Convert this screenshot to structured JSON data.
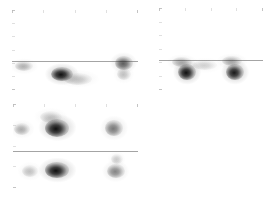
{
  "figure": {
    "title": "",
    "background": "#ffffff",
    "width": 273,
    "height": 203,
    "grid_color": "#b9b9b9",
    "divider_color": "#9a9a9a",
    "blob_color": "#1a1a1a"
  },
  "chart_data": {
    "type": "heatmap",
    "title": "",
    "subtitle": "",
    "xlabel": "",
    "ylabel": "",
    "legend": [],
    "annotations": [],
    "layout": {
      "panels": 3,
      "arrangement": "2x2 with bottom-right empty",
      "grid": "dashed",
      "colormap": "grayscale-inverted"
    },
    "panels": [
      {
        "name": "panel-top-left",
        "x": 12,
        "y": 10,
        "width": 126,
        "height": 80,
        "grid_cols": 4,
        "grid_rows": 6,
        "divider_y_frac": 0.64,
        "spots": [
          {
            "cx_frac": 0.095,
            "cy_frac": 0.7,
            "rx": 9,
            "ry": 5,
            "intensity": 0.28
          },
          {
            "cx_frac": 0.4,
            "cy_frac": 0.8,
            "rx": 11,
            "ry": 7,
            "intensity": 1.0
          },
          {
            "cx_frac": 0.52,
            "cy_frac": 0.86,
            "rx": 14,
            "ry": 6,
            "intensity": 0.22
          },
          {
            "cx_frac": 0.885,
            "cy_frac": 0.66,
            "rx": 9,
            "ry": 7,
            "intensity": 0.62
          },
          {
            "cx_frac": 0.885,
            "cy_frac": 0.8,
            "rx": 7,
            "ry": 6,
            "intensity": 0.22
          }
        ]
      },
      {
        "name": "panel-top-right",
        "x": 159,
        "y": 8,
        "width": 104,
        "height": 82,
        "grid_cols": 4,
        "grid_rows": 6,
        "divider_y_frac": 0.63,
        "spots": [
          {
            "cx_frac": 0.27,
            "cy_frac": 0.78,
            "rx": 9,
            "ry": 8,
            "intensity": 1.0
          },
          {
            "cx_frac": 0.22,
            "cy_frac": 0.66,
            "rx": 10,
            "ry": 5,
            "intensity": 0.3
          },
          {
            "cx_frac": 0.44,
            "cy_frac": 0.7,
            "rx": 12,
            "ry": 5,
            "intensity": 0.16
          },
          {
            "cx_frac": 0.73,
            "cy_frac": 0.78,
            "rx": 9,
            "ry": 8,
            "intensity": 0.95
          },
          {
            "cx_frac": 0.7,
            "cy_frac": 0.65,
            "rx": 10,
            "ry": 5,
            "intensity": 0.3
          }
        ]
      },
      {
        "name": "panel-bottom-left",
        "x": 13,
        "y": 104,
        "width": 125,
        "height": 84,
        "grid_cols": 4,
        "grid_rows": 4,
        "divider_y_frac": 0.555,
        "spots": [
          {
            "cx_frac": 0.075,
            "cy_frac": 0.3,
            "rx": 8,
            "ry": 6,
            "intensity": 0.3
          },
          {
            "cx_frac": 0.355,
            "cy_frac": 0.28,
            "rx": 12,
            "ry": 9,
            "intensity": 1.0
          },
          {
            "cx_frac": 0.3,
            "cy_frac": 0.15,
            "rx": 11,
            "ry": 6,
            "intensity": 0.2
          },
          {
            "cx_frac": 0.81,
            "cy_frac": 0.29,
            "rx": 9,
            "ry": 8,
            "intensity": 0.5
          },
          {
            "cx_frac": 0.135,
            "cy_frac": 0.8,
            "rx": 8,
            "ry": 6,
            "intensity": 0.22
          },
          {
            "cx_frac": 0.355,
            "cy_frac": 0.79,
            "rx": 12,
            "ry": 8,
            "intensity": 1.0
          },
          {
            "cx_frac": 0.82,
            "cy_frac": 0.8,
            "rx": 9,
            "ry": 7,
            "intensity": 0.45
          },
          {
            "cx_frac": 0.83,
            "cy_frac": 0.66,
            "rx": 6,
            "ry": 5,
            "intensity": 0.18
          }
        ]
      }
    ]
  }
}
